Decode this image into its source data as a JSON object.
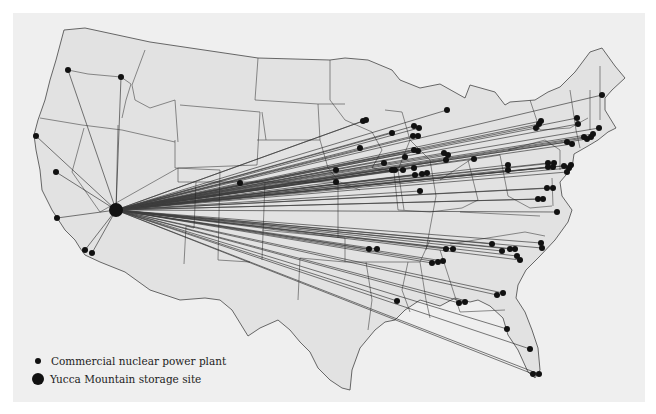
{
  "map": {
    "subject": "Routes from US commercial nuclear power plants to Yucca Mountain storage site",
    "colors": {
      "panel": "#efefef",
      "land": "#e2e2e2",
      "borders": "#444444",
      "routes": "#222222",
      "markers": "#111111"
    },
    "yucca": {
      "x": 116,
      "y": 210,
      "r": 7
    },
    "plants": [
      [
        68,
        70
      ],
      [
        121,
        77
      ],
      [
        36,
        136
      ],
      [
        56,
        172
      ],
      [
        57,
        218
      ],
      [
        85,
        250
      ],
      [
        92,
        253
      ],
      [
        240,
        183
      ],
      [
        360,
        148
      ],
      [
        363,
        121
      ],
      [
        366,
        120
      ],
      [
        392,
        133
      ],
      [
        414,
        126
      ],
      [
        419,
        128
      ],
      [
        413,
        136
      ],
      [
        418,
        136
      ],
      [
        447,
        110
      ],
      [
        392,
        170
      ],
      [
        414,
        168
      ],
      [
        414,
        150
      ],
      [
        418,
        151
      ],
      [
        384,
        163
      ],
      [
        405,
        157
      ],
      [
        395,
        170
      ],
      [
        403,
        170
      ],
      [
        415,
        175
      ],
      [
        422,
        174
      ],
      [
        427,
        173
      ],
      [
        420,
        191
      ],
      [
        444,
        153
      ],
      [
        446,
        160
      ],
      [
        448,
        155
      ],
      [
        474,
        159
      ],
      [
        336,
        170
      ],
      [
        336,
        182
      ],
      [
        508,
        165
      ],
      [
        508,
        170
      ],
      [
        536,
        128
      ],
      [
        539,
        124
      ],
      [
        541,
        121
      ],
      [
        577,
        118
      ],
      [
        578,
        124
      ],
      [
        602,
        95
      ],
      [
        599,
        128
      ],
      [
        584,
        137
      ],
      [
        587,
        139
      ],
      [
        591,
        137
      ],
      [
        593,
        134
      ],
      [
        567,
        142
      ],
      [
        572,
        144
      ],
      [
        548,
        163
      ],
      [
        554,
        163
      ],
      [
        548,
        167
      ],
      [
        553,
        167
      ],
      [
        564,
        166
      ],
      [
        569,
        168
      ],
      [
        571,
        165
      ],
      [
        567,
        172
      ],
      [
        547,
        188
      ],
      [
        553,
        188
      ],
      [
        538,
        199
      ],
      [
        543,
        199
      ],
      [
        557,
        212
      ],
      [
        369,
        249
      ],
      [
        377,
        249
      ],
      [
        446,
        249
      ],
      [
        453,
        249
      ],
      [
        492,
        244
      ],
      [
        502,
        251
      ],
      [
        510,
        249
      ],
      [
        515,
        249
      ],
      [
        517,
        256
      ],
      [
        520,
        260
      ],
      [
        541,
        243
      ],
      [
        542,
        248
      ],
      [
        432,
        263
      ],
      [
        438,
        262
      ],
      [
        443,
        261
      ],
      [
        497,
        295
      ],
      [
        503,
        293
      ],
      [
        459,
        303
      ],
      [
        465,
        302
      ],
      [
        397,
        301
      ],
      [
        507,
        329
      ],
      [
        530,
        349
      ],
      [
        533,
        374
      ],
      [
        539,
        374
      ]
    ]
  },
  "legend": {
    "items": [
      {
        "symbol": "small-dot",
        "label": "Commercial nuclear power plant"
      },
      {
        "symbol": "large-dot",
        "label": "Yucca Mountain storage site"
      }
    ]
  }
}
